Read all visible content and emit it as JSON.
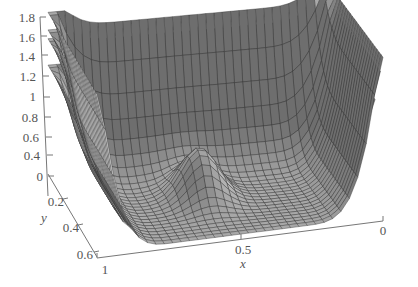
{
  "chart_data": {
    "type": "surface3d",
    "title": "",
    "xlabel": "x",
    "ylabel": "y",
    "zlabel": "",
    "x_ticks": [
      1,
      0.5,
      0
    ],
    "y_ticks": [
      0,
      0.2,
      0.4,
      0.6
    ],
    "z_ticks": [
      0,
      0.2,
      0.4,
      0.6,
      0.8,
      1,
      1.2,
      1.4,
      1.6,
      1.8
    ],
    "x_tick_labels": [
      "1",
      "0.5",
      "0"
    ],
    "y_tick_labels": [
      "0",
      "0.2",
      "0.4",
      "0.6"
    ],
    "z_tick_labels": [
      "0",
      "0.4",
      "0.6",
      "0.8",
      "1",
      "1.2",
      "1.4",
      "1.6",
      "1.8"
    ],
    "xlim": [
      0,
      1
    ],
    "ylim": [
      0,
      0.65
    ],
    "zlim": [
      0,
      1.8
    ],
    "grid": false,
    "legend": null,
    "series": [
      {
        "name": "layer-1",
        "wall_height": 1.8,
        "y_offset": 0.0,
        "bump_height": 0.55
      },
      {
        "name": "layer-2",
        "wall_height": 1.6,
        "y_offset": 0.05,
        "bump_height": 0.35
      },
      {
        "name": "layer-3",
        "wall_height": 1.5,
        "y_offset": 0.1,
        "bump_height": 0.25
      },
      {
        "name": "layer-4",
        "wall_height": 1.2,
        "y_offset": 0.15,
        "bump_height": 0.15
      }
    ],
    "colors": {
      "surface_dark": "#7a7a7a",
      "surface_light": "#d8d8d8",
      "mesh": "#333333",
      "axis": "#777777",
      "text": "#555555"
    }
  },
  "labels": {
    "x_title": "x",
    "y_title": "y",
    "x_tick_1": "1",
    "x_tick_05": "0.5",
    "x_tick_0": "0",
    "y_tick_0": "0",
    "y_tick_02": "0.2",
    "y_tick_04": "0.4",
    "y_tick_06": "0.6",
    "z_tick_0": "0",
    "z_tick_04": "0.4",
    "z_tick_06": "0.6",
    "z_tick_08": "0.8",
    "z_tick_1": "1",
    "z_tick_12": "1.2",
    "z_tick_14": "1.4",
    "z_tick_16": "1.6",
    "z_tick_18": "1.8"
  }
}
